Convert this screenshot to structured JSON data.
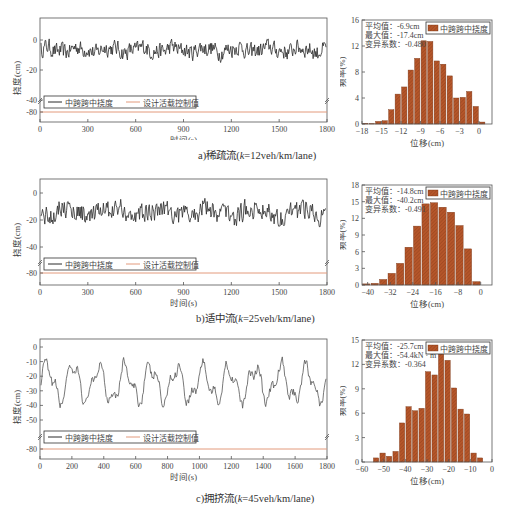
{
  "colors": {
    "series_line": "#2b2b2b",
    "limit_line": "#e39a7c",
    "bar_fill": "#b5562a",
    "bar_stroke": "#7a3818",
    "axis": "#555555"
  },
  "chart_data": [
    {
      "id": "a_line",
      "type": "line",
      "title": "",
      "xlabel": "时间(s)",
      "ylabel": "挠度(cm)",
      "xlim": [
        0,
        1800
      ],
      "xticks": [
        0,
        300,
        600,
        900,
        1200,
        1500,
        1800
      ],
      "yticks": [
        0,
        -20,
        -40,
        -80
      ],
      "axis_break": "between -40 and -80",
      "legend": [
        "中跨跨中挠度",
        "设计活载控制值"
      ],
      "series": [
        {
          "name": "中跨跨中挠度",
          "range_approx": [
            -17,
            1
          ],
          "mean_approx": -6.9,
          "oscillation": "high-frequency, amplitude ~10cm"
        },
        {
          "name": "设计活载控制值",
          "constant": -80
        }
      ]
    },
    {
      "id": "a_hist",
      "type": "bar",
      "xlabel": "位移(cm)",
      "ylabel": "频率(%)",
      "xlim": [
        -18,
        2
      ],
      "ylim": [
        0,
        16
      ],
      "xticks": [
        -18,
        -15,
        -12,
        -9,
        -6,
        -3,
        0
      ],
      "yticks": [
        0,
        4,
        8,
        12,
        16
      ],
      "legend": [
        "中跨跨中挠度"
      ],
      "bin_width": 1,
      "categories": [
        -17.5,
        -16.5,
        -15.5,
        -14.5,
        -13.5,
        -12.5,
        -11.5,
        -10.5,
        -9.5,
        -8.5,
        -7.5,
        -6.5,
        -5.5,
        -4.5,
        -3.5,
        -2.5,
        -1.5,
        -0.5,
        0.5,
        1.5
      ],
      "values": [
        0.1,
        0.05,
        0.4,
        0.5,
        2.2,
        4.6,
        5.7,
        8.3,
        10.1,
        12.8,
        12.7,
        9.7,
        9.2,
        7.4,
        4.0,
        4.1,
        5.0,
        2.7,
        0.3,
        0.0
      ],
      "annotations": [
        "平均值：-6.9cm",
        "最大值：-17.4cm",
        "变异系数：-0.480"
      ]
    },
    {
      "id": "b_line",
      "type": "line",
      "xlabel": "时间(s)",
      "ylabel": "挠度(cm)",
      "xlim": [
        0,
        1800
      ],
      "xticks": [
        0,
        300,
        600,
        900,
        1200,
        1500,
        1800
      ],
      "yticks": [
        0,
        -20,
        -40,
        -80
      ],
      "axis_break": "between -40 and -80",
      "legend": [
        "中跨跨中挠度",
        "设计活载控制值"
      ],
      "series": [
        {
          "name": "中跨跨中挠度",
          "range_approx": [
            -40,
            0
          ],
          "mean_approx": -14.8
        },
        {
          "name": "设计活载控制值",
          "constant": -80
        }
      ]
    },
    {
      "id": "b_hist",
      "type": "bar",
      "xlabel": "位移(cm)",
      "ylabel": "频率(%)",
      "xlim": [
        -42,
        4
      ],
      "ylim": [
        0,
        18
      ],
      "xticks": [
        -40,
        -32,
        -24,
        -16,
        -8,
        0
      ],
      "yticks": [
        0,
        3,
        6,
        9,
        12,
        15,
        18
      ],
      "legend": [
        "中跨跨中挠度"
      ],
      "bin_width": 3,
      "categories": [
        -40.5,
        -37.5,
        -34.5,
        -31.5,
        -28.5,
        -25.5,
        -22.5,
        -19.5,
        -16.5,
        -13.5,
        -10.5,
        -7.5,
        -4.5,
        -1.5
      ],
      "values": [
        0.2,
        0.3,
        1.0,
        2.1,
        3.9,
        6.8,
        10.6,
        14.6,
        14.8,
        14.0,
        13.1,
        10.7,
        6.5,
        0.6
      ],
      "annotations": [
        "平均值：-14.8cm",
        "最大值：-40.2cm",
        "变异系数：-0.491"
      ]
    },
    {
      "id": "c_line",
      "type": "line",
      "xlabel": "时间(s)",
      "ylabel": "挠度(cm)",
      "xlim": [
        0,
        1800
      ],
      "xticks": [
        0,
        200,
        400,
        600,
        800,
        1000,
        1200,
        1400,
        1600,
        1800
      ],
      "yticks": [
        0,
        -10,
        -20,
        -30,
        -40,
        -50,
        -80
      ],
      "axis_break": "between -50 and -80",
      "legend": [
        "中跨跨中挠度",
        "设计活载控制值"
      ],
      "series": [
        {
          "name": "中跨跨中挠度",
          "range_approx": [
            -54,
            -5
          ],
          "mean_approx": -25.7
        },
        {
          "name": "设计活载控制值",
          "constant": -80
        }
      ]
    },
    {
      "id": "c_hist",
      "type": "bar",
      "xlabel": "位移(cm)",
      "ylabel": "频率(%)",
      "xlim": [
        -60,
        0
      ],
      "ylim": [
        0,
        15
      ],
      "xticks": [
        -60,
        -50,
        -40,
        -30,
        -20,
        -10,
        0
      ],
      "yticks": [
        0,
        3,
        6,
        9,
        12,
        15
      ],
      "legend": [
        "中跨跨中挠度"
      ],
      "bin_width": 3,
      "categories": [
        -53.5,
        -50.5,
        -47.5,
        -44.5,
        -41.5,
        -38.5,
        -35.5,
        -32.5,
        -29.5,
        -26.5,
        -23.5,
        -20.5,
        -17.5,
        -14.5,
        -11.5,
        -8.5,
        -5.5
      ],
      "values": [
        0.5,
        1.1,
        0.7,
        1.3,
        4.8,
        6.8,
        6.3,
        6.6,
        11.1,
        10.7,
        13.5,
        12.5,
        9.1,
        6.5,
        5.9,
        1.1,
        0.5
      ],
      "annotations": [
        "平均值：-25.7cm",
        "最大值：-54.4kN · m",
        "变异系数：-0.364"
      ]
    }
  ],
  "captions": {
    "a": {
      "prefix": "a)稀疏流(",
      "k": "k",
      "suffix": "=12veh/km/lane)"
    },
    "b": {
      "prefix": "b)适中流(",
      "k": "k",
      "suffix": "=25veh/km/lane)"
    },
    "c": {
      "prefix": "c)拥挤流(",
      "k": "k",
      "suffix": "=45veh/km/lane)"
    }
  }
}
